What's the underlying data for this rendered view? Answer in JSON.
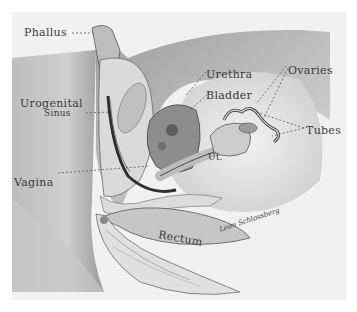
{
  "figure": {
    "labels": {
      "phallus": "Phallus",
      "urogenital_line1": "Urogenital",
      "urogenital_line2": "Sinus",
      "urethra": "Urethra",
      "bladder": "Bladder",
      "ovaries": "Ovaries",
      "tubes": "Tubes",
      "uterus": "Ut.",
      "vagina": "Vagina",
      "rectum": "Rectum"
    },
    "signature": "Leon Schlossberg",
    "colors": {
      "background": "#f1f1f1",
      "tissue_light": "#d8d8d8",
      "tissue_mid": "#a9a9a9",
      "tissue_dark": "#5a5a5a",
      "leader_line": "#555555"
    }
  }
}
